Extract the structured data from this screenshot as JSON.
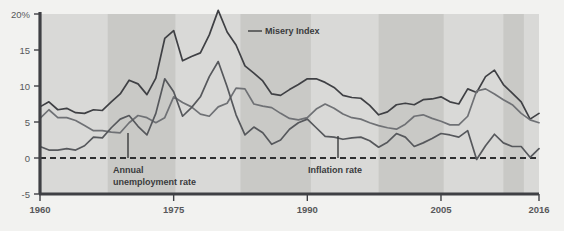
{
  "chart_data": {
    "type": "line",
    "title": "",
    "subtitle": "",
    "xlabel": "",
    "ylabel": "",
    "xlim": [
      1960,
      2016
    ],
    "ylim": [
      -5,
      20
    ],
    "grid": false,
    "legend_position": "inline-annotations",
    "y_ticks": [
      "20%",
      "15",
      "10",
      "5",
      "0",
      "-5"
    ],
    "y_tick_values": [
      20,
      15,
      10,
      5,
      0,
      -5
    ],
    "x_ticks": [
      "1960",
      "1975",
      "1990",
      "2005",
      "2016"
    ],
    "x_tick_values": [
      1960,
      1975,
      1990,
      2005,
      2016
    ],
    "zero_line": 0,
    "colors": {
      "misery_index": "#3f4044",
      "unemployment_rate": "#6f7175",
      "inflation_rate": "#56585c",
      "plot_background": "#d9d9d7",
      "recession_band": "#c9c9c6",
      "page_background": "#f2f2f0",
      "axis": "#3f4044",
      "text": "#57585a"
    },
    "recession_bands": [
      {
        "start": 1967.6,
        "end": 1975.2
      },
      {
        "start": 1982.5,
        "end": 1990.4
      },
      {
        "start": 1998.0,
        "end": 2005.3
      },
      {
        "start": 2012.0,
        "end": 2014.3
      }
    ],
    "x": [
      1960,
      1961,
      1962,
      1963,
      1964,
      1965,
      1966,
      1967,
      1968,
      1969,
      1970,
      1971,
      1972,
      1973,
      1974,
      1975,
      1976,
      1977,
      1978,
      1979,
      1980,
      1981,
      1982,
      1983,
      1984,
      1985,
      1986,
      1987,
      1988,
      1989,
      1990,
      1991,
      1992,
      1993,
      1994,
      1995,
      1996,
      1997,
      1998,
      1999,
      2000,
      2001,
      2002,
      2003,
      2004,
      2005,
      2006,
      2007,
      2008,
      2009,
      2010,
      2011,
      2012,
      2013,
      2014,
      2015,
      2016
    ],
    "series": [
      {
        "name": "Misery Index",
        "color": "#3f4044",
        "values": [
          7.1,
          7.8,
          6.7,
          6.9,
          6.3,
          6.2,
          6.7,
          6.6,
          7.8,
          8.9,
          10.8,
          10.3,
          8.8,
          11.1,
          16.6,
          17.7,
          13.5,
          14.1,
          14.6,
          17.1,
          20.5,
          17.5,
          15.7,
          12.8,
          11.8,
          10.7,
          8.9,
          8.7,
          9.5,
          10.2,
          11.0,
          11.0,
          10.5,
          9.8,
          8.7,
          8.4,
          8.3,
          7.3,
          6.0,
          6.4,
          7.4,
          7.6,
          7.4,
          8.1,
          8.2,
          8.5,
          7.8,
          7.5,
          9.6,
          9.1,
          11.3,
          12.2,
          10.2,
          9.0,
          7.8,
          5.4,
          6.2
        ]
      },
      {
        "name": "Annual unemployment rate",
        "color": "#6f7175",
        "values": [
          5.5,
          6.7,
          5.6,
          5.6,
          5.2,
          4.5,
          3.8,
          3.8,
          3.6,
          3.5,
          4.9,
          5.9,
          5.6,
          4.9,
          5.6,
          8.5,
          7.7,
          7.1,
          6.1,
          5.8,
          7.1,
          7.6,
          9.7,
          9.6,
          7.5,
          7.2,
          7.0,
          6.2,
          5.5,
          5.3,
          5.6,
          6.8,
          7.5,
          6.9,
          6.1,
          5.6,
          5.4,
          4.9,
          4.5,
          4.2,
          4.0,
          4.7,
          5.8,
          6.0,
          5.5,
          5.1,
          4.6,
          4.6,
          5.8,
          9.3,
          9.6,
          8.9,
          8.1,
          7.4,
          6.2,
          5.3,
          4.9
        ]
      },
      {
        "name": "Inflation rate",
        "color": "#56585c",
        "values": [
          1.6,
          1.1,
          1.1,
          1.3,
          1.1,
          1.7,
          2.9,
          2.8,
          4.2,
          5.4,
          5.9,
          4.4,
          3.2,
          6.2,
          11.0,
          9.2,
          5.8,
          7.0,
          8.5,
          11.3,
          13.4,
          9.9,
          6.0,
          3.2,
          4.3,
          3.5,
          1.9,
          2.5,
          4.0,
          4.9,
          5.4,
          4.2,
          3.0,
          2.9,
          2.6,
          2.8,
          2.9,
          2.4,
          1.5,
          2.2,
          3.4,
          2.9,
          1.6,
          2.1,
          2.7,
          3.4,
          3.2,
          2.9,
          3.8,
          -0.2,
          1.7,
          3.3,
          2.1,
          1.6,
          1.6,
          0.1,
          1.3
        ]
      }
    ],
    "annotations": [
      {
        "name": "misery-index-annotation",
        "text": "Misery Index",
        "x_px": 265,
        "y_px": 34,
        "leader": {
          "x1": 248,
          "y1": 31,
          "x2": 262,
          "y2": 31
        }
      },
      {
        "name": "unemployment-annotation",
        "line1": "Annual",
        "line2": "unemployment rate",
        "x_px": 113,
        "y_px": 173,
        "leader": {
          "x1": 128,
          "y1": 133,
          "x2": 128,
          "y2": 158
        }
      },
      {
        "name": "inflation-annotation",
        "text": "Inflation rate",
        "x_px": 308,
        "y_px": 173,
        "leader": {
          "x1": 338,
          "y1": 136,
          "x2": 338,
          "y2": 158
        }
      }
    ]
  }
}
